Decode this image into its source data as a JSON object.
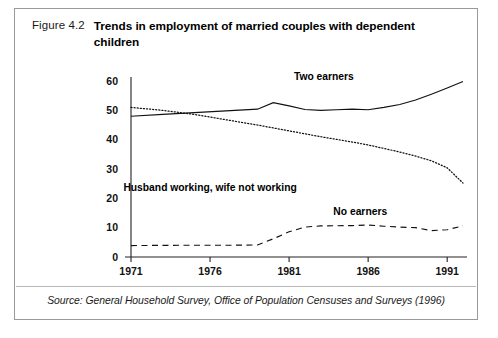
{
  "figure": {
    "number": "Figure 4.2",
    "title": "Trends in employment of married couples with dependent children",
    "source": "Source: General Household Survey, Office of Population Censuses and Surveys (1996)"
  },
  "chart_data": {
    "type": "line",
    "title": "Trends in employment of married couples with dependent children",
    "xlabel": "",
    "ylabel": "",
    "xlim": [
      1971,
      1992
    ],
    "ylim": [
      0,
      60
    ],
    "xticks": [
      "1971",
      "1976",
      "1981",
      "1986",
      "1991"
    ],
    "xtick_values": [
      1971,
      1976,
      1981,
      1986,
      1991
    ],
    "yticks": [
      "0",
      "10",
      "20",
      "30",
      "40",
      "50",
      "60"
    ],
    "ytick_values": [
      0,
      10,
      20,
      30,
      40,
      50,
      60
    ],
    "grid": false,
    "legend": "inline-labels",
    "series": [
      {
        "name": "Two earners",
        "style": "solid",
        "label_x": 1983.2,
        "label_y": 60.5,
        "x": [
          1971,
          1973,
          1975,
          1977,
          1979,
          1980,
          1981,
          1982,
          1983,
          1984,
          1985,
          1986,
          1987,
          1988,
          1989,
          1990,
          1991,
          1992
        ],
        "values": [
          48.0,
          48.6,
          49.2,
          49.8,
          50.4,
          52.6,
          51.5,
          50.3,
          50.0,
          50.2,
          50.4,
          50.2,
          51.0,
          52.0,
          53.5,
          55.5,
          57.6,
          59.8
        ]
      },
      {
        "name": "Husband working, wife not working",
        "style": "dotted",
        "label_x": 1976.0,
        "label_y": 22.5,
        "x": [
          1971,
          1973,
          1975,
          1977,
          1979,
          1981,
          1983,
          1985,
          1986,
          1987,
          1988,
          1989,
          1990,
          1991,
          1992
        ],
        "values": [
          51.0,
          50.0,
          48.6,
          46.8,
          45.0,
          43.0,
          41.0,
          39.2,
          38.2,
          37.0,
          35.8,
          34.4,
          32.8,
          30.4,
          25.2
        ]
      },
      {
        "name": "No earners",
        "style": "dashed",
        "label_x": 1985.5,
        "label_y": 14.2,
        "x": [
          1971,
          1974,
          1977,
          1979,
          1980,
          1981,
          1982,
          1983,
          1985,
          1986,
          1987,
          1988,
          1989,
          1990,
          1991,
          1992
        ],
        "values": [
          3.9,
          4.0,
          4.0,
          4.1,
          6.2,
          8.6,
          10.2,
          10.6,
          10.7,
          10.9,
          10.5,
          10.2,
          10.0,
          9.0,
          9.3,
          10.6
        ]
      }
    ]
  }
}
